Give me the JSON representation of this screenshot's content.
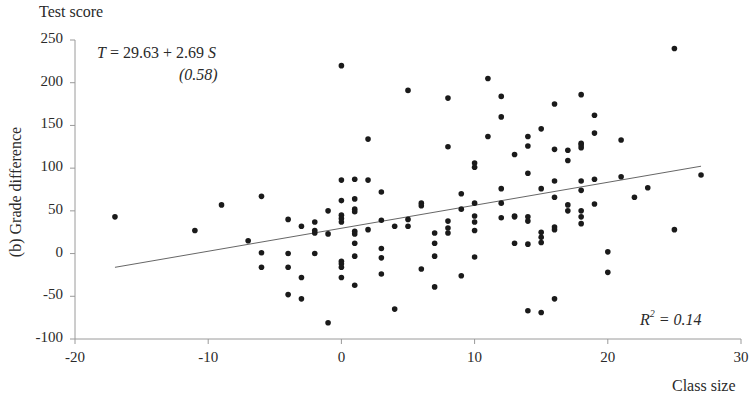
{
  "chart_data": {
    "type": "scatter",
    "title": "",
    "panel_label": "(b) Grade difference",
    "ylabel_top": "Test score",
    "ylabel": "(b) Grade difference",
    "xlabel": "Class size",
    "xlim": [
      -20,
      30
    ],
    "ylim": [
      -100,
      250
    ],
    "xticks": [
      -20,
      -10,
      0,
      10,
      20,
      30
    ],
    "yticks": [
      250,
      200,
      150,
      100,
      50,
      0,
      -50,
      -100
    ],
    "grid": false,
    "legend": null,
    "annotations": {
      "equation": "T = 29.63 + 2.69 S",
      "standard_error": "(0.58)",
      "r_squared": "R² = 0.14"
    },
    "fit_line": {
      "intercept": 29.63,
      "slope": 2.69,
      "x_range": [
        -17,
        27
      ]
    },
    "marker_color": "#1a1a1a",
    "line_color": "#555555",
    "points": [
      [
        -17,
        43
      ],
      [
        -11,
        27
      ],
      [
        -9,
        57
      ],
      [
        -7,
        15
      ],
      [
        -6,
        67
      ],
      [
        -6,
        1
      ],
      [
        -6,
        -16
      ],
      [
        -4,
        40
      ],
      [
        -4,
        0
      ],
      [
        -4,
        -16
      ],
      [
        -4,
        -48
      ],
      [
        -3,
        32
      ],
      [
        -3,
        -28
      ],
      [
        -3,
        -53
      ],
      [
        -2,
        37
      ],
      [
        -2,
        27
      ],
      [
        -2,
        24
      ],
      [
        -2,
        0
      ],
      [
        -1,
        50
      ],
      [
        -1,
        23
      ],
      [
        -1,
        -81
      ],
      [
        0,
        220
      ],
      [
        0,
        86
      ],
      [
        0,
        62
      ],
      [
        0,
        45
      ],
      [
        0,
        41
      ],
      [
        0,
        37
      ],
      [
        0,
        -9
      ],
      [
        0,
        -12
      ],
      [
        0,
        -16
      ],
      [
        0,
        -28
      ],
      [
        1,
        87
      ],
      [
        1,
        64
      ],
      [
        1,
        52
      ],
      [
        1,
        49
      ],
      [
        1,
        26
      ],
      [
        1,
        23
      ],
      [
        1,
        12
      ],
      [
        1,
        -3
      ],
      [
        1,
        -37
      ],
      [
        2,
        134
      ],
      [
        2,
        86
      ],
      [
        2,
        28
      ],
      [
        3,
        72
      ],
      [
        3,
        39
      ],
      [
        3,
        6
      ],
      [
        3,
        -5
      ],
      [
        3,
        -24
      ],
      [
        4,
        32
      ],
      [
        4,
        -65
      ],
      [
        5,
        191
      ],
      [
        5,
        40
      ],
      [
        5,
        32
      ],
      [
        6,
        59
      ],
      [
        6,
        56
      ],
      [
        6,
        -18
      ],
      [
        7,
        24
      ],
      [
        7,
        12
      ],
      [
        7,
        -3
      ],
      [
        7,
        -39
      ],
      [
        8,
        182
      ],
      [
        8,
        125
      ],
      [
        8,
        38
      ],
      [
        8,
        30
      ],
      [
        8,
        24
      ],
      [
        9,
        70
      ],
      [
        9,
        52
      ],
      [
        9,
        -26
      ],
      [
        10,
        106
      ],
      [
        10,
        101
      ],
      [
        10,
        59
      ],
      [
        10,
        44
      ],
      [
        10,
        37
      ],
      [
        10,
        27
      ],
      [
        10,
        -4
      ],
      [
        11,
        205
      ],
      [
        11,
        137
      ],
      [
        12,
        184
      ],
      [
        12,
        160
      ],
      [
        12,
        76
      ],
      [
        12,
        59
      ],
      [
        12,
        42
      ],
      [
        13,
        116
      ],
      [
        13,
        44
      ],
      [
        13,
        43
      ],
      [
        13,
        12
      ],
      [
        14,
        137
      ],
      [
        14,
        126
      ],
      [
        14,
        94
      ],
      [
        14,
        43
      ],
      [
        14,
        38
      ],
      [
        14,
        11
      ],
      [
        14,
        -67
      ],
      [
        15,
        146
      ],
      [
        15,
        76
      ],
      [
        15,
        25
      ],
      [
        15,
        19
      ],
      [
        15,
        13
      ],
      [
        15,
        -69
      ],
      [
        16,
        175
      ],
      [
        16,
        122
      ],
      [
        16,
        85
      ],
      [
        16,
        66
      ],
      [
        16,
        31
      ],
      [
        16,
        28
      ],
      [
        16,
        -53
      ],
      [
        17,
        121
      ],
      [
        17,
        109
      ],
      [
        17,
        57
      ],
      [
        17,
        50
      ],
      [
        18,
        186
      ],
      [
        18,
        129
      ],
      [
        18,
        127
      ],
      [
        18,
        124
      ],
      [
        18,
        85
      ],
      [
        18,
        74
      ],
      [
        18,
        50
      ],
      [
        18,
        43
      ],
      [
        18,
        35
      ],
      [
        19,
        162
      ],
      [
        19,
        141
      ],
      [
        19,
        87
      ],
      [
        19,
        58
      ],
      [
        20,
        2
      ],
      [
        20,
        -22
      ],
      [
        21,
        133
      ],
      [
        21,
        90
      ],
      [
        22,
        66
      ],
      [
        23,
        77
      ],
      [
        25,
        240
      ],
      [
        25,
        28
      ],
      [
        27,
        92
      ]
    ]
  }
}
